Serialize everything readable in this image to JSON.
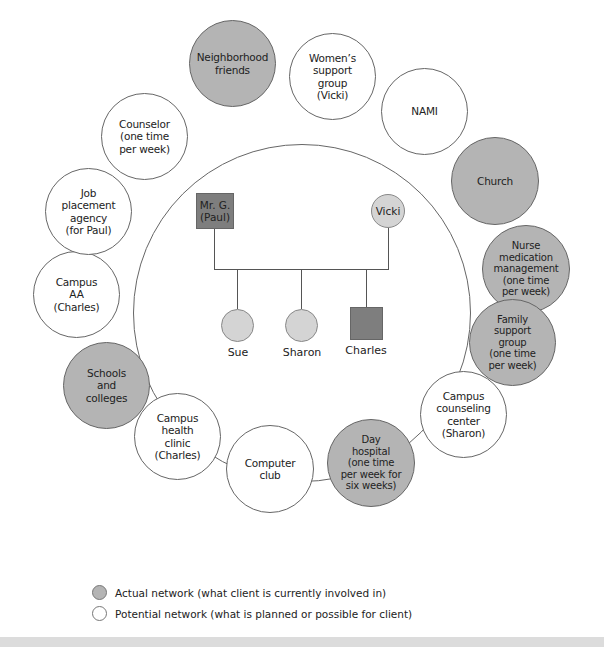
{
  "diagram": {
    "type": "ecomap",
    "colors": {
      "actual": "#b4b4b4",
      "potential": "#ffffff",
      "male": "#7e7e7e",
      "female": "#d4d4d4"
    },
    "nodes": [
      {
        "id": "neighborhood",
        "label": "Neighborhood\nfriends",
        "status": "actual"
      },
      {
        "id": "womens",
        "label": "Women’s\nsupport\ngroup\n(Vicki)",
        "status": "potential"
      },
      {
        "id": "nami",
        "label": "NAMI",
        "status": "potential"
      },
      {
        "id": "church",
        "label": "Church",
        "status": "actual"
      },
      {
        "id": "nurse",
        "label": "Nurse\nmedication\nmanagement\n(one time\nper week)",
        "status": "actual"
      },
      {
        "id": "family",
        "label": "Family\nsupport\ngroup\n(one time\nper week)",
        "status": "actual"
      },
      {
        "id": "counseling",
        "label": "Campus\ncounseling\ncenter\n(Sharon)",
        "status": "potential"
      },
      {
        "id": "dayhospital",
        "label": "Day\nhospital\n(one time\nper week for\nsix weeks)",
        "status": "actual"
      },
      {
        "id": "computer",
        "label": "Computer\nclub",
        "status": "potential"
      },
      {
        "id": "healthclinic",
        "label": "Campus\nhealth\nclinic\n(Charles)",
        "status": "potential"
      },
      {
        "id": "schools",
        "label": "Schools\nand\ncolleges",
        "status": "actual"
      },
      {
        "id": "aa",
        "label": "Campus\nAA\n(Charles)",
        "status": "potential"
      },
      {
        "id": "job",
        "label": "Job\nplacement\nagency\n(for Paul)",
        "status": "potential"
      },
      {
        "id": "counselor",
        "label": "Counselor\n(one time\nper week)",
        "status": "potential"
      }
    ],
    "family": {
      "father": "Mr. G.\n(Paul)",
      "mother": "Vicki",
      "children": [
        "Sue",
        "Sharon",
        "Charles"
      ]
    }
  },
  "legend": {
    "actual": "Actual network (what client is currently involved in)",
    "potential": "Potential network (what is planned or possible for client)"
  }
}
